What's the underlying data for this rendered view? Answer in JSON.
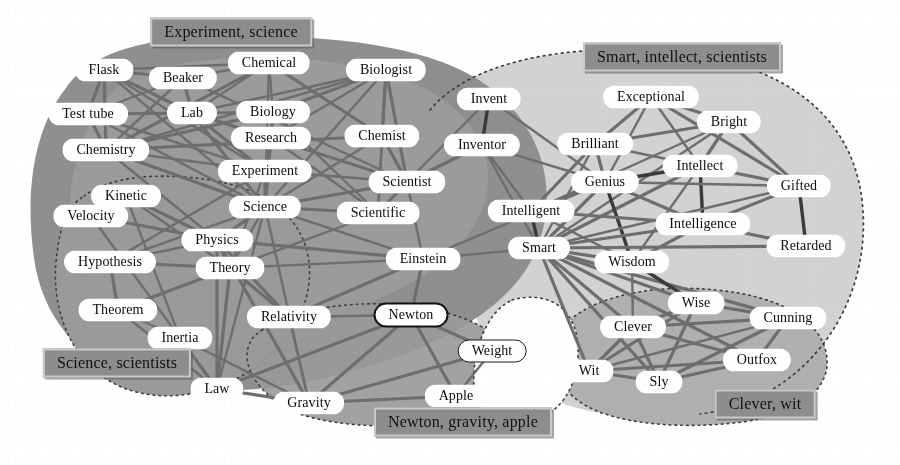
{
  "figure": {
    "type": "semantic-network-graph",
    "width": 900,
    "height": 465,
    "background": "#ffffff"
  },
  "palette": {
    "page_background": "#ffffff",
    "region_dark": "#8e8e8e",
    "region_mid": "#a9a9a9",
    "region_light": "#c9c9c9",
    "region_lightest": "#d6d6d6",
    "node_fill": "#ffffff",
    "node_text": "#0b0b0b",
    "edge_dark": "#3a3a3a",
    "edge_mid": "#6e6e6e",
    "edge_light": "#8f8f8f",
    "cluster_label_fill": "#8d8d8d",
    "cluster_label_border": "#c9c9c9",
    "highlight_outline": "#121212"
  },
  "cluster_labels": [
    {
      "id": "experiment-science",
      "text": "Experiment, science",
      "x": 231,
      "y": 32
    },
    {
      "id": "smart-intellect-scientists",
      "text": "Smart, intellect, scientists",
      "x": 682,
      "y": 57
    },
    {
      "id": "science-scientists",
      "text": "Science, scientists",
      "x": 117,
      "y": 363
    },
    {
      "id": "newton-gravity-apple",
      "text": "Newton, gravity, apple",
      "x": 463,
      "y": 422
    },
    {
      "id": "clever-wit",
      "text": "Clever, wit",
      "x": 765,
      "y": 404
    }
  ],
  "nodes": [
    {
      "id": "flask",
      "label": "Flask",
      "x": 104,
      "y": 70,
      "style": "plain"
    },
    {
      "id": "beaker",
      "label": "Beaker",
      "x": 183,
      "y": 78,
      "style": "plain"
    },
    {
      "id": "chemical",
      "label": "Chemical",
      "x": 269,
      "y": 63,
      "style": "plain"
    },
    {
      "id": "biologist",
      "label": "Biologist",
      "x": 386,
      "y": 70,
      "style": "plain"
    },
    {
      "id": "test-tube",
      "label": "Test tube",
      "x": 88,
      "y": 114,
      "style": "plain"
    },
    {
      "id": "lab",
      "label": "Lab",
      "x": 192,
      "y": 113,
      "style": "plain"
    },
    {
      "id": "biology",
      "label": "Biology",
      "x": 273,
      "y": 112,
      "style": "plain"
    },
    {
      "id": "invent",
      "label": "Invent",
      "x": 489,
      "y": 99,
      "style": "plain"
    },
    {
      "id": "exceptional",
      "label": "Exceptional",
      "x": 651,
      "y": 97,
      "style": "plain"
    },
    {
      "id": "bright",
      "label": "Bright",
      "x": 729,
      "y": 122,
      "style": "plain"
    },
    {
      "id": "research",
      "label": "Research",
      "x": 271,
      "y": 138,
      "style": "plain"
    },
    {
      "id": "chemist",
      "label": "Chemist",
      "x": 382,
      "y": 136,
      "style": "plain"
    },
    {
      "id": "inventor",
      "label": "Inventor",
      "x": 482,
      "y": 145,
      "style": "plain"
    },
    {
      "id": "brilliant",
      "label": "Brilliant",
      "x": 595,
      "y": 144,
      "style": "plain"
    },
    {
      "id": "chemistry",
      "label": "Chemistry",
      "x": 106,
      "y": 150,
      "style": "plain"
    },
    {
      "id": "intellect",
      "label": "Intellect",
      "x": 700,
      "y": 166,
      "style": "plain"
    },
    {
      "id": "experiment",
      "label": "Experiment",
      "x": 265,
      "y": 171,
      "style": "plain"
    },
    {
      "id": "genius",
      "label": "Genius",
      "x": 605,
      "y": 182,
      "style": "plain"
    },
    {
      "id": "gifted",
      "label": "Gifted",
      "x": 799,
      "y": 186,
      "style": "plain"
    },
    {
      "id": "scientist",
      "label": "Scientist",
      "x": 407,
      "y": 182,
      "style": "plain"
    },
    {
      "id": "kinetic",
      "label": "Kinetic",
      "x": 126,
      "y": 196,
      "style": "plain"
    },
    {
      "id": "velocity",
      "label": "Velocity",
      "x": 91,
      "y": 216,
      "style": "plain"
    },
    {
      "id": "science",
      "label": "Science",
      "x": 265,
      "y": 207,
      "style": "plain"
    },
    {
      "id": "scientific",
      "label": "Scientific",
      "x": 378,
      "y": 213,
      "style": "plain"
    },
    {
      "id": "intelligent",
      "label": "Intelligent",
      "x": 531,
      "y": 211,
      "style": "plain"
    },
    {
      "id": "intelligence",
      "label": "Intelligence",
      "x": 703,
      "y": 224,
      "style": "plain"
    },
    {
      "id": "physics",
      "label": "Physics",
      "x": 217,
      "y": 240,
      "style": "plain"
    },
    {
      "id": "retarded",
      "label": "Retarded",
      "x": 806,
      "y": 246,
      "style": "plain"
    },
    {
      "id": "hypothesis",
      "label": "Hypothesis",
      "x": 110,
      "y": 262,
      "style": "plain"
    },
    {
      "id": "theory",
      "label": "Theory",
      "x": 230,
      "y": 268,
      "style": "plain"
    },
    {
      "id": "einstein",
      "label": "Einstein",
      "x": 423,
      "y": 259,
      "style": "plain"
    },
    {
      "id": "smart",
      "label": "Smart",
      "x": 539,
      "y": 248,
      "style": "plain"
    },
    {
      "id": "wisdom",
      "label": "Wisdom",
      "x": 632,
      "y": 262,
      "style": "plain"
    },
    {
      "id": "theorem",
      "label": "Theorem",
      "x": 118,
      "y": 310,
      "style": "plain"
    },
    {
      "id": "relativity",
      "label": "Relativity",
      "x": 289,
      "y": 317,
      "style": "plain"
    },
    {
      "id": "newton",
      "label": "Newton",
      "x": 411,
      "y": 315,
      "style": "outline"
    },
    {
      "id": "wise",
      "label": "Wise",
      "x": 696,
      "y": 303,
      "style": "plain"
    },
    {
      "id": "cunning",
      "label": "Cunning",
      "x": 788,
      "y": 318,
      "style": "plain"
    },
    {
      "id": "inertia",
      "label": "Inertia",
      "x": 180,
      "y": 338,
      "style": "plain"
    },
    {
      "id": "clever",
      "label": "Clever",
      "x": 633,
      "y": 327,
      "style": "plain"
    },
    {
      "id": "weight",
      "label": "Weight",
      "x": 492,
      "y": 351,
      "style": "thin"
    },
    {
      "id": "outfox",
      "label": "Outfox",
      "x": 757,
      "y": 360,
      "style": "plain"
    },
    {
      "id": "wit",
      "label": "Wit",
      "x": 589,
      "y": 371,
      "style": "plain"
    },
    {
      "id": "law",
      "label": "Law",
      "x": 217,
      "y": 389,
      "style": "plain"
    },
    {
      "id": "sly",
      "label": "Sly",
      "x": 659,
      "y": 382,
      "style": "plain"
    },
    {
      "id": "gravity",
      "label": "Gravity",
      "x": 309,
      "y": 403,
      "style": "plain"
    },
    {
      "id": "apple",
      "label": "Apple",
      "x": 456,
      "y": 396,
      "style": "plain"
    }
  ],
  "edges": [
    {
      "from": "flask",
      "to": "test-tube",
      "weight": 3
    },
    {
      "from": "flask",
      "to": "lab",
      "weight": 3
    },
    {
      "from": "flask",
      "to": "chemistry",
      "weight": 3
    },
    {
      "from": "flask",
      "to": "beaker",
      "weight": 3
    },
    {
      "from": "flask",
      "to": "chemical",
      "weight": 2
    },
    {
      "from": "flask",
      "to": "science",
      "weight": 2
    },
    {
      "from": "flask",
      "to": "experiment",
      "weight": 2
    },
    {
      "from": "beaker",
      "to": "lab",
      "weight": 3
    },
    {
      "from": "beaker",
      "to": "chemistry",
      "weight": 2
    },
    {
      "from": "beaker",
      "to": "test-tube",
      "weight": 2
    },
    {
      "from": "beaker",
      "to": "chemical",
      "weight": 2
    },
    {
      "from": "beaker",
      "to": "scientist",
      "weight": 2
    },
    {
      "from": "chemical",
      "to": "chemistry",
      "weight": 3
    },
    {
      "from": "chemical",
      "to": "biology",
      "weight": 2
    },
    {
      "from": "chemical",
      "to": "chemist",
      "weight": 3
    },
    {
      "from": "chemical",
      "to": "science",
      "weight": 2
    },
    {
      "from": "chemical",
      "to": "lab",
      "weight": 2
    },
    {
      "from": "biologist",
      "to": "biology",
      "weight": 3
    },
    {
      "from": "biologist",
      "to": "chemist",
      "weight": 3
    },
    {
      "from": "biologist",
      "to": "scientist",
      "weight": 3
    },
    {
      "from": "biologist",
      "to": "scientific",
      "weight": 2
    },
    {
      "from": "biologist",
      "to": "research",
      "weight": 2
    },
    {
      "from": "biologist",
      "to": "science",
      "weight": 2
    },
    {
      "from": "biologist",
      "to": "chemistry",
      "weight": 2
    },
    {
      "from": "biologist",
      "to": "lab",
      "weight": 2
    },
    {
      "from": "test-tube",
      "to": "lab",
      "weight": 3
    },
    {
      "from": "test-tube",
      "to": "chemistry",
      "weight": 3
    },
    {
      "from": "test-tube",
      "to": "experiment",
      "weight": 2
    },
    {
      "from": "test-tube",
      "to": "science",
      "weight": 2
    },
    {
      "from": "lab",
      "to": "research",
      "weight": 3
    },
    {
      "from": "lab",
      "to": "experiment",
      "weight": 3
    },
    {
      "from": "lab",
      "to": "science",
      "weight": 3
    },
    {
      "from": "lab",
      "to": "scientist",
      "weight": 2
    },
    {
      "from": "lab",
      "to": "biology",
      "weight": 2
    },
    {
      "from": "biology",
      "to": "chemistry",
      "weight": 3
    },
    {
      "from": "biology",
      "to": "science",
      "weight": 3
    },
    {
      "from": "biology",
      "to": "research",
      "weight": 2
    },
    {
      "from": "biology",
      "to": "scientific",
      "weight": 2
    },
    {
      "from": "research",
      "to": "experiment",
      "weight": 3
    },
    {
      "from": "research",
      "to": "science",
      "weight": 3
    },
    {
      "from": "research",
      "to": "scientist",
      "weight": 2
    },
    {
      "from": "research",
      "to": "scientific",
      "weight": 2
    },
    {
      "from": "chemist",
      "to": "scientist",
      "weight": 3
    },
    {
      "from": "chemist",
      "to": "chemistry",
      "weight": 3
    },
    {
      "from": "chemist",
      "to": "scientific",
      "weight": 2
    },
    {
      "from": "chemist",
      "to": "science",
      "weight": 2
    },
    {
      "from": "chemistry",
      "to": "science",
      "weight": 3
    },
    {
      "from": "chemistry",
      "to": "experiment",
      "weight": 2
    },
    {
      "from": "chemistry",
      "to": "physics",
      "weight": 2
    },
    {
      "from": "experiment",
      "to": "science",
      "weight": 3
    },
    {
      "from": "experiment",
      "to": "scientist",
      "weight": 2
    },
    {
      "from": "experiment",
      "to": "hypothesis",
      "weight": 2
    },
    {
      "from": "experiment",
      "to": "theory",
      "weight": 2
    },
    {
      "from": "scientist",
      "to": "scientific",
      "weight": 3
    },
    {
      "from": "scientist",
      "to": "science",
      "weight": 3
    },
    {
      "from": "scientist",
      "to": "einstein",
      "weight": 2
    },
    {
      "from": "scientist",
      "to": "inventor",
      "weight": 2
    },
    {
      "from": "scientific",
      "to": "science",
      "weight": 3
    },
    {
      "from": "scientific",
      "to": "theory",
      "weight": 2
    },
    {
      "from": "science",
      "to": "physics",
      "weight": 3
    },
    {
      "from": "science",
      "to": "theory",
      "weight": 2
    },
    {
      "from": "science",
      "to": "hypothesis",
      "weight": 2
    },
    {
      "from": "science",
      "to": "einstein",
      "weight": 2
    },
    {
      "from": "science",
      "to": "law",
      "weight": 2
    },
    {
      "from": "science",
      "to": "gravity",
      "weight": 2
    },
    {
      "from": "kinetic",
      "to": "velocity",
      "weight": 3
    },
    {
      "from": "kinetic",
      "to": "physics",
      "weight": 3
    },
    {
      "from": "kinetic",
      "to": "theory",
      "weight": 2
    },
    {
      "from": "kinetic",
      "to": "inertia",
      "weight": 2
    },
    {
      "from": "velocity",
      "to": "physics",
      "weight": 3
    },
    {
      "from": "velocity",
      "to": "inertia",
      "weight": 2
    },
    {
      "from": "hypothesis",
      "to": "theory",
      "weight": 3
    },
    {
      "from": "hypothesis",
      "to": "theorem",
      "weight": 3
    },
    {
      "from": "hypothesis",
      "to": "physics",
      "weight": 2
    },
    {
      "from": "theorem",
      "to": "theory",
      "weight": 3
    },
    {
      "from": "theorem",
      "to": "law",
      "weight": 2
    },
    {
      "from": "theorem",
      "to": "inertia",
      "weight": 2
    },
    {
      "from": "physics",
      "to": "theory",
      "weight": 3
    },
    {
      "from": "physics",
      "to": "relativity",
      "weight": 3
    },
    {
      "from": "physics",
      "to": "einstein",
      "weight": 3
    },
    {
      "from": "physics",
      "to": "law",
      "weight": 3
    },
    {
      "from": "physics",
      "to": "gravity",
      "weight": 3
    },
    {
      "from": "theory",
      "to": "relativity",
      "weight": 3
    },
    {
      "from": "theory",
      "to": "law",
      "weight": 3
    },
    {
      "from": "theory",
      "to": "einstein",
      "weight": 2
    },
    {
      "from": "relativity",
      "to": "einstein",
      "weight": 3
    },
    {
      "from": "relativity",
      "to": "newton",
      "weight": 2
    },
    {
      "from": "relativity",
      "to": "gravity",
      "weight": 2
    },
    {
      "from": "inertia",
      "to": "law",
      "weight": 3
    },
    {
      "from": "inertia",
      "to": "gravity",
      "weight": 2
    },
    {
      "from": "einstein",
      "to": "newton",
      "weight": 3
    },
    {
      "from": "einstein",
      "to": "smart",
      "weight": 2
    },
    {
      "from": "einstein",
      "to": "genius",
      "weight": 2
    },
    {
      "from": "newton",
      "to": "gravity",
      "weight": 3
    },
    {
      "from": "newton",
      "to": "apple",
      "weight": 3
    },
    {
      "from": "newton",
      "to": "weight",
      "weight": 3
    },
    {
      "from": "newton",
      "to": "law",
      "weight": 3
    },
    {
      "from": "law",
      "to": "gravity",
      "weight": 3
    },
    {
      "from": "gravity",
      "to": "apple",
      "weight": 3
    },
    {
      "from": "gravity",
      "to": "weight",
      "weight": 3
    },
    {
      "from": "apple",
      "to": "weight",
      "weight": 2
    },
    {
      "from": "invent",
      "to": "inventor",
      "weight": 4
    },
    {
      "from": "invent",
      "to": "scientist",
      "weight": 2
    },
    {
      "from": "invent",
      "to": "genius",
      "weight": 2
    },
    {
      "from": "inventor",
      "to": "scientist",
      "weight": 3
    },
    {
      "from": "inventor",
      "to": "intelligent",
      "weight": 2
    },
    {
      "from": "inventor",
      "to": "genius",
      "weight": 2
    },
    {
      "from": "inventor",
      "to": "smart",
      "weight": 2
    },
    {
      "from": "exceptional",
      "to": "brilliant",
      "weight": 3
    },
    {
      "from": "exceptional",
      "to": "bright",
      "weight": 3
    },
    {
      "from": "exceptional",
      "to": "gifted",
      "weight": 3
    },
    {
      "from": "exceptional",
      "to": "intellect",
      "weight": 2
    },
    {
      "from": "exceptional",
      "to": "genius",
      "weight": 2
    },
    {
      "from": "bright",
      "to": "brilliant",
      "weight": 3
    },
    {
      "from": "bright",
      "to": "intellect",
      "weight": 3
    },
    {
      "from": "bright",
      "to": "gifted",
      "weight": 3
    },
    {
      "from": "bright",
      "to": "intelligent",
      "weight": 2
    },
    {
      "from": "bright",
      "to": "smart",
      "weight": 2
    },
    {
      "from": "brilliant",
      "to": "genius",
      "weight": 3
    },
    {
      "from": "brilliant",
      "to": "intelligent",
      "weight": 3
    },
    {
      "from": "brilliant",
      "to": "smart",
      "weight": 2
    },
    {
      "from": "brilliant",
      "to": "intellect",
      "weight": 2
    },
    {
      "from": "intellect",
      "to": "intelligence",
      "weight": 4
    },
    {
      "from": "intellect",
      "to": "genius",
      "weight": 4
    },
    {
      "from": "intellect",
      "to": "gifted",
      "weight": 3
    },
    {
      "from": "intellect",
      "to": "smart",
      "weight": 3
    },
    {
      "from": "intellect",
      "to": "wisdom",
      "weight": 2
    },
    {
      "from": "genius",
      "to": "intelligent",
      "weight": 3
    },
    {
      "from": "genius",
      "to": "smart",
      "weight": 3
    },
    {
      "from": "genius",
      "to": "intelligence",
      "weight": 3
    },
    {
      "from": "genius",
      "to": "wisdom",
      "weight": 4
    },
    {
      "from": "genius",
      "to": "gifted",
      "weight": 2
    },
    {
      "from": "gifted",
      "to": "intelligence",
      "weight": 3
    },
    {
      "from": "gifted",
      "to": "retarded",
      "weight": 4
    },
    {
      "from": "gifted",
      "to": "smart",
      "weight": 2
    },
    {
      "from": "intelligent",
      "to": "smart",
      "weight": 4
    },
    {
      "from": "intelligent",
      "to": "intelligence",
      "weight": 3
    },
    {
      "from": "intelligent",
      "to": "wisdom",
      "weight": 2
    },
    {
      "from": "intelligence",
      "to": "smart",
      "weight": 3
    },
    {
      "from": "intelligence",
      "to": "wisdom",
      "weight": 3
    },
    {
      "from": "intelligence",
      "to": "retarded",
      "weight": 3
    },
    {
      "from": "smart",
      "to": "wisdom",
      "weight": 3
    },
    {
      "from": "smart",
      "to": "retarded",
      "weight": 3
    },
    {
      "from": "smart",
      "to": "wise",
      "weight": 3
    },
    {
      "from": "smart",
      "to": "clever",
      "weight": 3
    },
    {
      "from": "smart",
      "to": "cunning",
      "weight": 3
    },
    {
      "from": "smart",
      "to": "wit",
      "weight": 3
    },
    {
      "from": "smart",
      "to": "sly",
      "weight": 3
    },
    {
      "from": "smart",
      "to": "outfox",
      "weight": 3
    },
    {
      "from": "wisdom",
      "to": "wise",
      "weight": 4
    },
    {
      "from": "wisdom",
      "to": "clever",
      "weight": 2
    },
    {
      "from": "wise",
      "to": "clever",
      "weight": 3
    },
    {
      "from": "wise",
      "to": "cunning",
      "weight": 3
    },
    {
      "from": "wise",
      "to": "wit",
      "weight": 3
    },
    {
      "from": "wise",
      "to": "sly",
      "weight": 3
    },
    {
      "from": "clever",
      "to": "cunning",
      "weight": 3
    },
    {
      "from": "clever",
      "to": "wit",
      "weight": 3
    },
    {
      "from": "clever",
      "to": "sly",
      "weight": 3
    },
    {
      "from": "clever",
      "to": "outfox",
      "weight": 3
    },
    {
      "from": "cunning",
      "to": "sly",
      "weight": 3
    },
    {
      "from": "cunning",
      "to": "outfox",
      "weight": 3
    },
    {
      "from": "cunning",
      "to": "wit",
      "weight": 2
    },
    {
      "from": "wit",
      "to": "sly",
      "weight": 3
    },
    {
      "from": "wit",
      "to": "outfox",
      "weight": 3
    },
    {
      "from": "sly",
      "to": "outfox",
      "weight": 3
    }
  ]
}
